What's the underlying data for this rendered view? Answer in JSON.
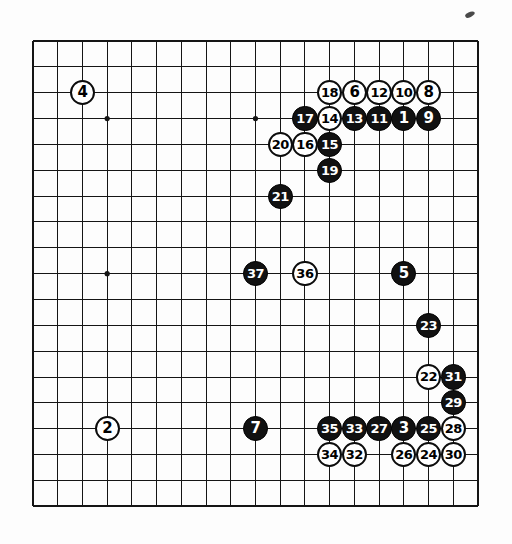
{
  "diagram": {
    "type": "go-game-record",
    "board_size": 19,
    "board": {
      "line_color": "#151515",
      "background_color": "#ffffff",
      "star_point_columns": [
        3,
        9,
        15
      ],
      "star_point_rows": [
        3,
        9,
        15
      ],
      "visible_star_points": [
        {
          "col": 3,
          "row": 3
        },
        {
          "col": 9,
          "row": 3
        },
        {
          "col": 3,
          "row": 9
        }
      ]
    },
    "colors": {
      "black_stone": "#111111",
      "white_stone": "#ffffff",
      "black_label": "#ffffff",
      "white_label": "#000000"
    },
    "moves": [
      {
        "n": "1",
        "color": "black",
        "col": 15,
        "row": 3
      },
      {
        "n": "2",
        "color": "white",
        "col": 3,
        "row": 15
      },
      {
        "n": "3",
        "color": "black",
        "col": 15,
        "row": 15
      },
      {
        "n": "4",
        "color": "white",
        "col": 2,
        "row": 2
      },
      {
        "n": "5",
        "color": "black",
        "col": 15,
        "row": 9
      },
      {
        "n": "6",
        "color": "white",
        "col": 13,
        "row": 2
      },
      {
        "n": "7",
        "color": "black",
        "col": 9,
        "row": 15
      },
      {
        "n": "8",
        "color": "white",
        "col": 16,
        "row": 2
      },
      {
        "n": "9",
        "color": "black",
        "col": 16,
        "row": 3
      },
      {
        "n": "10",
        "color": "white",
        "col": 15,
        "row": 2
      },
      {
        "n": "11",
        "color": "black",
        "col": 14,
        "row": 3
      },
      {
        "n": "12",
        "color": "white",
        "col": 14,
        "row": 2
      },
      {
        "n": "13",
        "color": "black",
        "col": 13,
        "row": 3
      },
      {
        "n": "14",
        "color": "white",
        "col": 12,
        "row": 3
      },
      {
        "n": "15",
        "color": "black",
        "col": 12,
        "row": 4
      },
      {
        "n": "16",
        "color": "white",
        "col": 11,
        "row": 4
      },
      {
        "n": "17",
        "color": "black",
        "col": 11,
        "row": 3
      },
      {
        "n": "18",
        "color": "white",
        "col": 12,
        "row": 2
      },
      {
        "n": "19",
        "color": "black",
        "col": 12,
        "row": 5
      },
      {
        "n": "20",
        "color": "white",
        "col": 10,
        "row": 4
      },
      {
        "n": "21",
        "color": "black",
        "col": 10,
        "row": 6
      },
      {
        "n": "22",
        "color": "white",
        "col": 16,
        "row": 13
      },
      {
        "n": "23",
        "color": "black",
        "col": 16,
        "row": 11
      },
      {
        "n": "24",
        "color": "white",
        "col": 16,
        "row": 16
      },
      {
        "n": "25",
        "color": "black",
        "col": 16,
        "row": 15
      },
      {
        "n": "26",
        "color": "white",
        "col": 15,
        "row": 16
      },
      {
        "n": "27",
        "color": "black",
        "col": 14,
        "row": 15
      },
      {
        "n": "28",
        "color": "white",
        "col": 17,
        "row": 15
      },
      {
        "n": "29",
        "color": "black",
        "col": 17,
        "row": 14
      },
      {
        "n": "30",
        "color": "white",
        "col": 17,
        "row": 16
      },
      {
        "n": "31",
        "color": "black",
        "col": 17,
        "row": 13
      },
      {
        "n": "32",
        "color": "white",
        "col": 13,
        "row": 16
      },
      {
        "n": "33",
        "color": "black",
        "col": 13,
        "row": 15
      },
      {
        "n": "34",
        "color": "white",
        "col": 12,
        "row": 16
      },
      {
        "n": "35",
        "color": "black",
        "col": 12,
        "row": 15
      },
      {
        "n": "36",
        "color": "white",
        "col": 11,
        "row": 9
      },
      {
        "n": "37",
        "color": "black",
        "col": 9,
        "row": 9
      }
    ]
  }
}
